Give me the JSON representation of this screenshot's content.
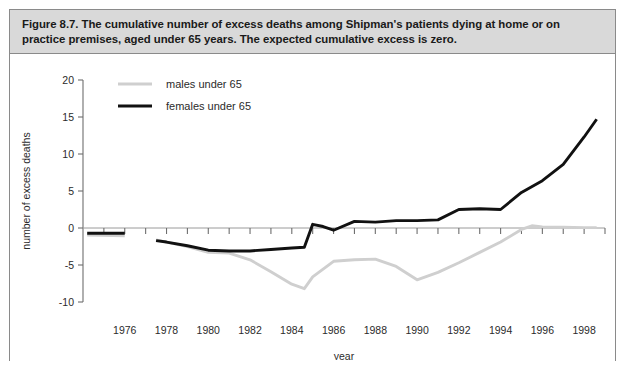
{
  "figure": {
    "caption": "Figure 8.7. The cumulative number of excess deaths among Shipman's patients dying at home or on practice premises, aged under 65 years. The expected cumulative excess is zero."
  },
  "chart_data": {
    "type": "line",
    "title": "",
    "xlabel": "year",
    "ylabel": "number of excess deaths",
    "xlim": [
      1974,
      1999
    ],
    "ylim": [
      -10,
      20
    ],
    "ytick_labels": [
      "20",
      "15",
      "10",
      "5",
      "0",
      "-5",
      "-10"
    ],
    "yticks": [
      20,
      15,
      10,
      5,
      0,
      -5,
      -10
    ],
    "xtick_labels": [
      "1976",
      "1978",
      "1980",
      "1982",
      "1984",
      "1986",
      "1988",
      "1990",
      "1992",
      "1994",
      "1996",
      "1998"
    ],
    "xticks": [
      1976,
      1978,
      1980,
      1982,
      1984,
      1986,
      1988,
      1990,
      1992,
      1994,
      1996,
      1998
    ],
    "minor_xtick_interval": 1,
    "grid": false,
    "legend_position": "top-left inside",
    "colors": {
      "males": "#cfcfcf",
      "females": "#111111",
      "axis": "#6e6e6e",
      "caption_band": "#d9d9d9"
    },
    "series": [
      {
        "name": "males under 65",
        "color": "#cfcfcf",
        "segments": [
          {
            "x": [
              1974.2,
              1976.0
            ],
            "y": [
              -0.95,
              -1.05
            ]
          },
          {
            "x": [
              1977.5,
              1978.0,
              1979.0,
              1980.0,
              1981.0,
              1982.0,
              1983.0,
              1984.0,
              1984.6,
              1985.0,
              1986.0,
              1987.0,
              1988.0,
              1989.0,
              1990.0,
              1991.0,
              1992.0,
              1993.0,
              1994.0,
              1995.0,
              1995.5,
              1996.0,
              1997.0,
              1998.0,
              1998.6
            ],
            "y": [
              -1.6,
              -1.9,
              -2.5,
              -3.3,
              -3.4,
              -4.3,
              -5.9,
              -7.6,
              -8.2,
              -6.6,
              -4.5,
              -4.3,
              -4.2,
              -5.2,
              -7.0,
              -6.0,
              -4.7,
              -3.3,
              -1.9,
              -0.2,
              0.3,
              0.15,
              0.1,
              0.05,
              0.05
            ]
          }
        ]
      },
      {
        "name": "females under 65",
        "color": "#111111",
        "segments": [
          {
            "x": [
              1974.2,
              1976.0
            ],
            "y": [
              -0.7,
              -0.7
            ]
          },
          {
            "x": [
              1977.5,
              1978.0,
              1979.0,
              1980.0,
              1981.0,
              1982.0,
              1983.0,
              1984.0,
              1984.6,
              1985.0,
              1985.5,
              1986.0,
              1987.0,
              1988.0,
              1989.0,
              1990.0,
              1991.0,
              1992.0,
              1993.0,
              1994.0,
              1995.0,
              1996.0,
              1997.0,
              1998.0,
              1998.6
            ],
            "y": [
              -1.7,
              -1.9,
              -2.4,
              -3.0,
              -3.1,
              -3.1,
              -2.9,
              -2.7,
              -2.6,
              0.5,
              0.2,
              -0.3,
              0.9,
              0.8,
              1.0,
              1.0,
              1.1,
              2.5,
              2.6,
              2.5,
              4.8,
              6.4,
              8.6,
              12.3,
              14.7
            ]
          }
        ]
      }
    ],
    "legend": [
      {
        "label": "males under 65",
        "color": "#cfcfcf"
      },
      {
        "label": "females under 65",
        "color": "#111111"
      }
    ]
  }
}
